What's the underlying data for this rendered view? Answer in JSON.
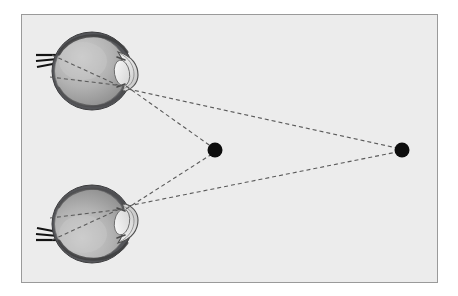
{
  "figure": {
    "title": "Binocular convergence of two eyes on a near point and a far point",
    "caption": "",
    "background_color": "#ececec",
    "page_color": "#ffffff",
    "frame_border_color": "#9a9a9a"
  },
  "colors": {
    "sclera_outline": "#4a4a4a",
    "sclera_fill_light": "#c9c9c9",
    "sclera_fill_dark": "#8f8f8f",
    "cornea_fill": "#e3e3e3",
    "lens_fill": "#efefef",
    "optic_nerve": "#1a1a1a",
    "sight_line": "#5a5a5a",
    "target_dot": "#0d0d0d"
  },
  "frame": {
    "x": 21,
    "y": 14,
    "width": 417,
    "height": 269
  },
  "eyes": [
    {
      "name": "upper-eye",
      "label": "Upper eye",
      "center_x": 92,
      "center_y": 71,
      "radius_x": 40,
      "radius_y": 39,
      "orientation": "right-facing",
      "flip_vertical": false,
      "pupil_x": 126,
      "pupil_y": 86,
      "optic_nerve_x": 40,
      "optic_nerve_y": 58,
      "nerve_strands": 3
    },
    {
      "name": "lower-eye",
      "label": "Lower eye",
      "center_x": 92,
      "center_y": 224,
      "radius_x": 40,
      "radius_y": 39,
      "orientation": "right-facing",
      "flip_vertical": true,
      "pupil_x": 126,
      "pupil_y": 209,
      "optic_nerve_x": 40,
      "optic_nerve_y": 237,
      "nerve_strands": 3
    }
  ],
  "targets": [
    {
      "name": "near-point",
      "label": "Near fixation point",
      "x": 215,
      "y": 150,
      "radius": 7.5
    },
    {
      "name": "far-point",
      "label": "Far point",
      "x": 402,
      "y": 150,
      "radius": 7.5
    }
  ],
  "sight_lines": [
    {
      "name": "upper-eye-to-near-point",
      "from": "upper-eye-node",
      "to": "near-point",
      "x1": 126,
      "y1": 86,
      "x2": 212,
      "y2": 147
    },
    {
      "name": "lower-eye-to-near-point",
      "from": "lower-eye-node",
      "to": "near-point",
      "x1": 126,
      "y1": 209,
      "x2": 212,
      "y2": 154
    },
    {
      "name": "upper-eye-to-far-point",
      "from": "upper-eye-node",
      "to": "far-point",
      "x1": 128,
      "y1": 89,
      "x2": 397,
      "y2": 148
    },
    {
      "name": "lower-eye-to-far-point",
      "from": "lower-eye-node",
      "to": "far-point",
      "x1": 128,
      "y1": 206,
      "x2": 397,
      "y2": 152
    },
    {
      "name": "upper-eye-internal-ray-upper",
      "x1": 52,
      "y1": 55,
      "x2": 124,
      "y2": 88,
      "internal": true
    },
    {
      "name": "upper-eye-internal-ray-lower",
      "x1": 50,
      "y1": 77,
      "x2": 124,
      "y2": 86,
      "internal": true
    },
    {
      "name": "lower-eye-internal-ray-lower",
      "x1": 52,
      "y1": 240,
      "x2": 124,
      "y2": 207,
      "internal": true
    },
    {
      "name": "lower-eye-internal-ray-upper",
      "x1": 50,
      "y1": 218,
      "x2": 124,
      "y2": 209,
      "internal": true
    }
  ],
  "dash_pattern": "4 3",
  "stroke_width": 1.1
}
